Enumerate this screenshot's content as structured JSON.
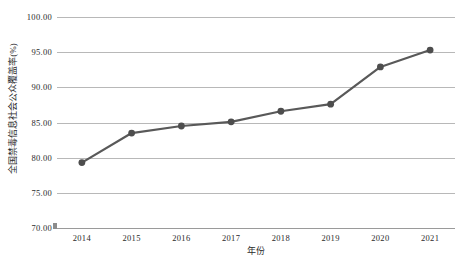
{
  "chart_data": {
    "type": "line",
    "title": "",
    "subtitle": "",
    "xlabel": "年份",
    "ylabel": "全国禁毒信息社会公众覆盖率(%)",
    "categories": [
      "2014",
      "2015",
      "2016",
      "2017",
      "2018",
      "2019",
      "2020",
      "2021"
    ],
    "values": [
      79.3,
      83.5,
      84.5,
      85.1,
      86.6,
      87.6,
      92.9,
      95.3
    ],
    "series": [
      {
        "name": "全国禁毒信息社会公众覆盖率",
        "values": [
          79.3,
          83.5,
          84.5,
          85.1,
          86.6,
          87.6,
          92.9,
          95.3
        ]
      }
    ],
    "ylim": [
      70.0,
      100.0
    ],
    "ytick_values": [
      70.0,
      75.0,
      80.0,
      85.0,
      90.0,
      95.0,
      100.0
    ],
    "ytick_labels": [
      "70.00",
      "75.00",
      "80.00",
      "85.00",
      "90.00",
      "95.00",
      "100.00"
    ],
    "xtick_labels": [
      "2014",
      "2015",
      "2016",
      "2017",
      "2018",
      "2019",
      "2020",
      "2021"
    ],
    "grid": true,
    "grid_axis": "y",
    "legend": false,
    "legend_position": "none",
    "marker": "circle",
    "line_color": "#595959",
    "marker_color": "#4d4d4d",
    "grid_color": "#b8b8b8",
    "background_color": "#ffffff",
    "text_color": "#2b2b2b"
  }
}
